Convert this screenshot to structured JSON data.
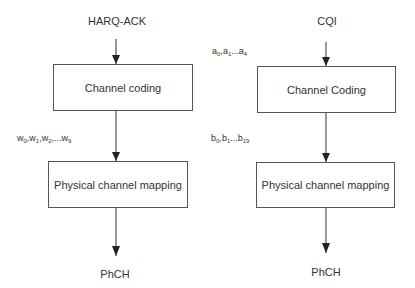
{
  "diagram": {
    "left_chain": {
      "input_label": "HARQ-ACK",
      "box1_label": "Channel coding",
      "intermediate_sequence": {
        "symbol": "w",
        "items": [
          {
            "base": "w",
            "sub": "0",
            "sep": ","
          },
          {
            "base": "w",
            "sub": "1",
            "sep": ","
          },
          {
            "base": "w",
            "sub": "2",
            "sep": ",..."
          },
          {
            "base": "w",
            "sub": "9",
            "sep": ""
          }
        ]
      },
      "box2_label": "Physical channel mapping",
      "output_label": "PhCH"
    },
    "right_chain": {
      "input_label": "CQI",
      "input_sequence": {
        "symbol": "a",
        "items": [
          {
            "base": "a",
            "sub": "0",
            "sep": ","
          },
          {
            "base": "a",
            "sub": "1",
            "sep": "..."
          },
          {
            "base": "a",
            "sub": "4",
            "sep": ""
          }
        ]
      },
      "box1_label": "Channel Coding",
      "intermediate_sequence": {
        "symbol": "b",
        "items": [
          {
            "base": "b",
            "sub": "0",
            "sep": ","
          },
          {
            "base": "b",
            "sub": "1",
            "sep": "..."
          },
          {
            "base": "b",
            "sub": "19",
            "sep": ""
          }
        ]
      },
      "box2_label": "Physical channel mapping",
      "output_label": "PhCH"
    }
  },
  "colors": {
    "line": "#333333",
    "box_border": "#555555",
    "text": "#333333",
    "background": "#ffffff"
  }
}
